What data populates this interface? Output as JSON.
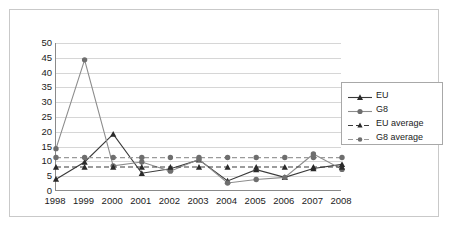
{
  "chart_data": {
    "type": "line",
    "title": "",
    "subtitle": "",
    "xlabel": "",
    "ylabel": "",
    "categories": [
      "1998",
      "1999",
      "2000",
      "2001",
      "2002",
      "2003",
      "2004",
      "2005",
      "2006",
      "2007",
      "2008"
    ],
    "ylim": [
      0,
      50
    ],
    "yticks": [
      0,
      5,
      10,
      15,
      20,
      25,
      30,
      35,
      40,
      45,
      50
    ],
    "ytick_labels": [
      "0",
      "5",
      "10",
      "15",
      "20",
      "25",
      "30",
      "35",
      "40",
      "45",
      "50"
    ],
    "grid": true,
    "grid_axis": "y",
    "legend_position": "upper right",
    "series": [
      {
        "name": "EU",
        "marker": "triangle",
        "linestyle": "solid",
        "color": "#3a3a3a",
        "values": [
          4.0,
          9.8,
          19.2,
          6.0,
          7.5,
          10.5,
          3.4,
          7.2,
          4.6,
          7.6,
          9.0
        ]
      },
      {
        "name": "G8",
        "marker": "circle",
        "linestyle": "solid",
        "color": "#8c8c8c",
        "values": [
          14.3,
          44.3,
          8.5,
          9.8,
          6.7,
          10.7,
          2.7,
          3.9,
          4.6,
          12.5,
          7.3
        ]
      },
      {
        "name": "EU average",
        "marker": "triangle",
        "linestyle": "dashed",
        "color": "#3a3a3a",
        "constant": 8.1,
        "values": [
          8.1,
          8.1,
          8.1,
          8.1,
          8.1,
          8.1,
          8.1,
          8.1,
          8.1,
          8.1,
          8.1
        ]
      },
      {
        "name": "G8 average",
        "marker": "circle",
        "linestyle": "dashed",
        "color": "#9a9a9a",
        "constant": 11.3,
        "values": [
          11.3,
          11.3,
          11.3,
          11.3,
          11.3,
          11.3,
          11.3,
          11.3,
          11.3,
          11.3,
          11.3
        ]
      }
    ]
  },
  "legend": {
    "items": [
      {
        "label": "EU"
      },
      {
        "label": "G8"
      },
      {
        "label": "EU average"
      },
      {
        "label": "G8 average"
      }
    ]
  },
  "colors": {
    "eu_line": "#3a3a3a",
    "g8_line": "#8c8c8c",
    "eu_average_line": "#3a3a3a",
    "g8_average_line": "#9a9a9a",
    "gridline": "#d6d6d6",
    "axis": "#8a8a8a",
    "outer_border": "#c9c9c9",
    "background": "#ffffff",
    "text": "#1b1b1b"
  }
}
